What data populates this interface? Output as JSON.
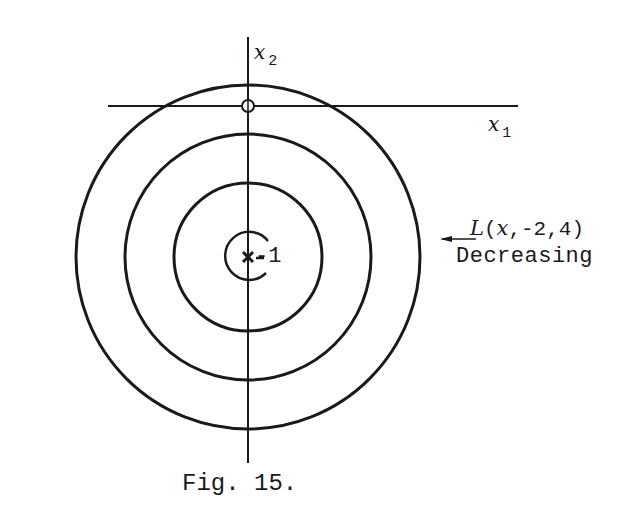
{
  "figure": {
    "caption": "Fig. 15.",
    "axes": {
      "x_label": "x",
      "x_sub": "1",
      "y_label": "x",
      "y_sub": "2"
    },
    "center_label": "-1",
    "annotation": {
      "function": "L(x,-2,4)",
      "function_name": "L",
      "function_args_var": "x",
      "function_args_rest": ",-2,4)",
      "direction": "Decreasing"
    },
    "colors": {
      "ink": "#1a1a1a",
      "background": "#ffffff"
    }
  }
}
